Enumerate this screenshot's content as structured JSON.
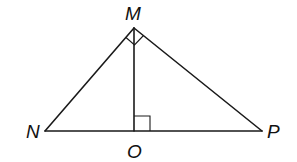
{
  "diagram": {
    "type": "right-triangle-with-altitude",
    "colors": {
      "stroke": "#1a1a1a",
      "background": "#ffffff"
    },
    "labels": {
      "M": "M",
      "N": "N",
      "O": "O",
      "P": "P"
    },
    "points": {
      "M": [
        134,
        28
      ],
      "N": [
        45,
        131
      ],
      "O": [
        134,
        131
      ],
      "P": [
        262,
        131
      ]
    },
    "segments": [
      "MN",
      "MP",
      "NP",
      "MO"
    ],
    "right_angles": [
      "NMP",
      "MON"
    ]
  }
}
